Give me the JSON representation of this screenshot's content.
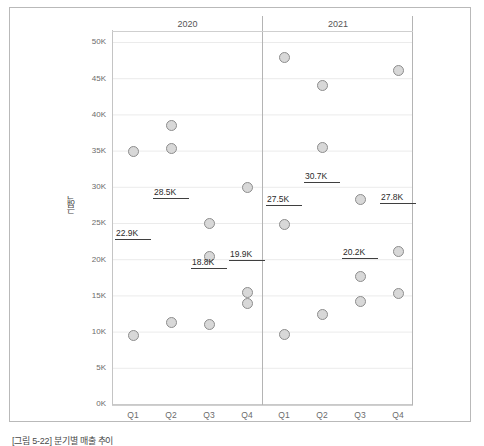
{
  "chart_data": {
    "type": "scatter",
    "title": "",
    "xlabel": "",
    "ylabel": "금액",
    "ylim": [
      0,
      50000
    ],
    "ytick_labels": [
      "0K",
      "5K",
      "10K",
      "15K",
      "20K",
      "25K",
      "30K",
      "35K",
      "40K",
      "45K",
      "50K"
    ],
    "ytick_values": [
      0,
      5000,
      10000,
      15000,
      20000,
      25000,
      30000,
      35000,
      40000,
      45000,
      50000
    ],
    "grid": true,
    "legend": "none",
    "panels": [
      {
        "label": "2020",
        "categories": [
          "Q1",
          "Q2",
          "Q3",
          "Q4"
        ],
        "groups": [
          {
            "category": "Q1",
            "points": [
              35000,
              9500
            ],
            "reference_line": {
              "value": 22900,
              "label": "22.9K"
            }
          },
          {
            "category": "Q2",
            "points": [
              38500,
              35400,
              11300
            ],
            "reference_line": {
              "value": 28500,
              "label": "28.5K"
            }
          },
          {
            "category": "Q3",
            "points": [
              25000,
              20400,
              11000
            ],
            "reference_line": {
              "value": 18800,
              "label": "18.8K"
            }
          },
          {
            "category": "Q4",
            "points": [
              30000,
              15500,
              14000
            ],
            "reference_line": {
              "value": 19900,
              "label": "19.9K"
            }
          }
        ]
      },
      {
        "label": "2021",
        "categories": [
          "Q1",
          "Q2",
          "Q3",
          "Q4"
        ],
        "groups": [
          {
            "category": "Q1",
            "points": [
              47900,
              24800,
              9600
            ],
            "reference_line": {
              "value": 27500,
              "label": "27.5K"
            }
          },
          {
            "category": "Q2",
            "points": [
              44000,
              35500,
              12400
            ],
            "reference_line": {
              "value": 30700,
              "label": "30.7K"
            }
          },
          {
            "category": "Q3",
            "points": [
              28300,
              17700,
              14200
            ],
            "reference_line": {
              "value": 20200,
              "label": "20.2K"
            }
          },
          {
            "category": "Q4",
            "points": [
              46200,
              21200,
              15400
            ],
            "reference_line": {
              "value": 27800,
              "label": "27.8K"
            }
          }
        ]
      }
    ],
    "colors": {
      "dot_fill": "#d8d8d8",
      "dot_stroke": "#8d8d8d",
      "reference_line": "#3f3f3f",
      "gridline": "#e6e6e6",
      "axis": "#c4c4c4",
      "text": "#6b6b6b"
    }
  },
  "axis": {
    "y_label": "금액",
    "y_ticks": [
      "50K",
      "45K",
      "40K",
      "35K",
      "30K",
      "25K",
      "20K",
      "15K",
      "10K",
      "5K",
      "0K"
    ],
    "x_ticks_2020": [
      "Q1",
      "Q2",
      "Q3",
      "Q4"
    ],
    "x_ticks_2021": [
      "Q1",
      "Q2",
      "Q3",
      "Q4"
    ]
  },
  "panel_headers": {
    "left": "2020",
    "right": "2021"
  },
  "reference_labels": {
    "y2020_q1": "22.9K",
    "y2020_q2": "28.5K",
    "y2020_q3": "18.8K",
    "y2020_q4": "19.9K",
    "y2021_q1": "27.5K",
    "y2021_q2": "30.7K",
    "y2021_q3": "20.2K",
    "y2021_q4": "27.8K"
  },
  "caption": "[그림 5-22] 분기별 매출 추이"
}
